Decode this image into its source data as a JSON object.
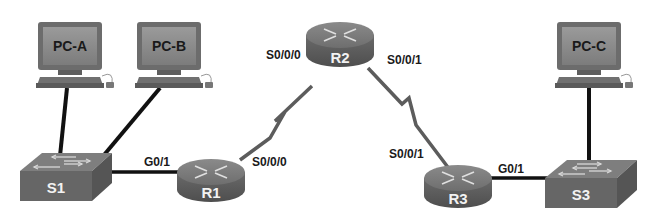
{
  "diagram": {
    "type": "network-topology",
    "colors": {
      "background": "#ffffff",
      "device_fill": "#6f6f6f",
      "device_dark": "#4a4a4a",
      "device_light": "#8c8c8c",
      "screen_fill": "#8a8a8a",
      "ethernet_link": "#111111",
      "serial_link": "#5c5c5c",
      "label_text": "#1a1a1a",
      "device_text": "#f2f2f2"
    },
    "devices": {
      "pc_a": {
        "label": "PC-A",
        "type": "pc"
      },
      "pc_b": {
        "label": "PC-B",
        "type": "pc"
      },
      "pc_c": {
        "label": "PC-C",
        "type": "pc"
      },
      "s1": {
        "label": "S1",
        "type": "switch"
      },
      "s3": {
        "label": "S3",
        "type": "switch"
      },
      "r1": {
        "label": "R1",
        "type": "router"
      },
      "r2": {
        "label": "R2",
        "type": "router"
      },
      "r3": {
        "label": "R3",
        "type": "router"
      }
    },
    "interfaces": {
      "r1_g01": "G0/1",
      "r1_s000": "S0/0/0",
      "r2_s000": "S0/0/0",
      "r2_s001": "S0/0/1",
      "r3_s001": "S0/0/1",
      "r3_g01": "G0/1"
    },
    "links": [
      {
        "from": "PC-A",
        "to": "S1",
        "type": "ethernet"
      },
      {
        "from": "PC-B",
        "to": "S1",
        "type": "ethernet"
      },
      {
        "from": "S1",
        "to": "R1",
        "type": "ethernet",
        "to_interface": "G0/1"
      },
      {
        "from": "R1",
        "to": "R2",
        "type": "serial",
        "from_interface": "S0/0/0",
        "to_interface": "S0/0/0"
      },
      {
        "from": "R2",
        "to": "R3",
        "type": "serial",
        "from_interface": "S0/0/1",
        "to_interface": "S0/0/1"
      },
      {
        "from": "R3",
        "to": "S3",
        "type": "ethernet",
        "from_interface": "G0/1"
      },
      {
        "from": "PC-C",
        "to": "S3",
        "type": "ethernet"
      }
    ]
  }
}
